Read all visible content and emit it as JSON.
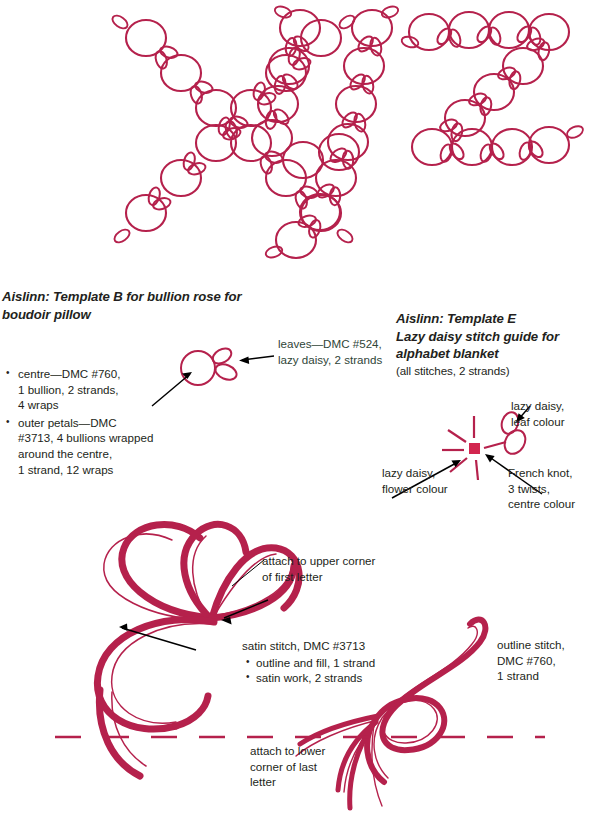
{
  "page": {
    "ink_color": "#b5214c",
    "text_color": "#231f20",
    "green_text_color": "#2f4538",
    "background": "#ffffff"
  },
  "alphabet_art": {
    "caption_letters": "xyz",
    "description": "bubble letters x y z formed from chains of circular flower heads with lazy-daisy leaf loops"
  },
  "template_b": {
    "heading_line1": "Aislinn: Template B for bullion rose for",
    "heading_line2": "boudoir pillow",
    "bullets": [
      "centre—DMC #760,\n1 bullion, 2 strands,\n4 wraps",
      "outer petals—DMC\n#3713, 4 bullions wrapped\naround the centre,\n1 strand, 12 wraps"
    ],
    "bullet_1_lines": [
      "centre—DMC #760,",
      "1 bullion, 2 strands,",
      "4 wraps"
    ],
    "bullet_2_lines": [
      "outer petals—DMC",
      "#3713, 4 bullions wrapped",
      "around the centre,",
      "1 strand, 12 wraps"
    ],
    "leaves_label_lines": [
      "leaves—DMC #524,",
      "lazy daisy, 2 strands"
    ]
  },
  "template_e": {
    "heading_line1": "Aislinn: Template E",
    "heading_line2": "Lazy daisy stitch guide for",
    "heading_line3": "alphabet blanket",
    "subheading": "(all stitches, 2 strands)",
    "labels": {
      "lazy_daisy_leaf": [
        "lazy daisy,",
        "leaf colour"
      ],
      "lazy_daisy_flower": [
        "lazy daisy,",
        "flower colour"
      ],
      "french_knot": [
        "French knot,",
        "3 twists,",
        "centre colour"
      ]
    }
  },
  "flourish": {
    "attach_upper_lines": [
      "attach to upper corner",
      "of first letter"
    ],
    "satin_stitch_title": "satin stitch, DMC #3713",
    "satin_stitch_bullets": [
      "outline and fill, 1 strand",
      "satin work, 2 strands"
    ],
    "outline_stitch_lines": [
      "outline stitch,",
      "DMC #760,",
      "1 strand"
    ],
    "attach_lower_lines": [
      "attach to lower",
      "corner of last",
      "letter"
    ]
  }
}
